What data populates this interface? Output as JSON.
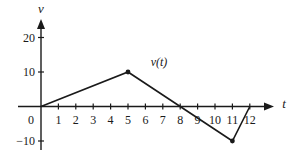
{
  "chart_data": {
    "type": "line",
    "title": "",
    "xlabel": "t",
    "ylabel": "v",
    "series": [
      {
        "name": "v(t)",
        "x": [
          0,
          5,
          8,
          11,
          12
        ],
        "values": [
          0,
          10,
          0,
          -10,
          0
        ],
        "marked_points": [
          [
            5,
            10
          ],
          [
            11,
            -10
          ]
        ]
      }
    ],
    "x_ticks": [
      1,
      2,
      3,
      4,
      5,
      6,
      7,
      8,
      9,
      10,
      11,
      12
    ],
    "y_ticks": [
      -10,
      10,
      20
    ],
    "origin_label": "0",
    "xlim": [
      -1.5,
      13.5
    ],
    "ylim": [
      -15,
      25
    ],
    "grid": false,
    "legend": "inline label near curve"
  },
  "colors": {
    "ink": "#1a1a1a",
    "background": "#ffffff"
  },
  "layout": {
    "origin_px": [
      41,
      106.5
    ],
    "px_per_t": 17.4,
    "px_per_v": 3.45
  }
}
